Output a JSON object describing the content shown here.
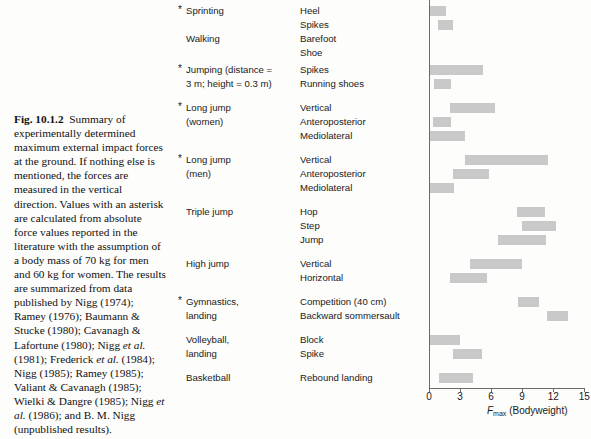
{
  "caption": {
    "figure_number": "Fig. 10.1.2",
    "text_1": "Summary of experimentally determined maximum external impact forces at the ground. If nothing else is mentioned, the forces are measured in the vertical direction. Values with an asterisk are calculated from absolute force values reported in the literature with the assumption of a body mass of 70 kg for men and 60 kg for women. The results are summarized from data published by Nigg (1974); Ramey (1976); Baumann & Stucke (1980); Cavanagh & Lafortune (1980); Nigg ",
    "italic_1": "et al.",
    "text_2": " (1981); Frederick ",
    "italic_2": "et al.",
    "text_3": " (1984); Nigg (1985); Ramey (1985); Valiant & Cavanagh (1985); Wielki & Dangre (1985); Nigg ",
    "italic_3": "et al.",
    "text_4": " (1986); and B. M. Nigg (unpublished results)."
  },
  "axis": {
    "xlabel_symbol": "F",
    "xlabel_sub": "max",
    "xlabel_unit": "(Bodyweight)",
    "ticks": [
      0,
      3,
      6,
      9,
      12,
      15
    ],
    "tick_labels": [
      "0",
      "3",
      "6",
      "9",
      "12",
      "15"
    ],
    "xmin": 0,
    "xmax": 15
  },
  "style": {
    "bar_color": "#c9c9c9",
    "axis_color": "#6b6b6b",
    "text_color": "#1a1a1a"
  },
  "chart_data": {
    "type": "bar",
    "subtype": "range-bar",
    "title": "Summary of experimentally determined maximum external impact forces at the ground",
    "xlabel": "Fmax (Bodyweight)",
    "ylabel": "",
    "xlim": [
      0,
      15
    ],
    "grid": false,
    "legend": null,
    "units": "bodyweight",
    "rows": [
      {
        "activity": "Sprinting",
        "asterisk": true,
        "condition": "Heel",
        "low": 0.1,
        "high": 1.6,
        "y": 4
      },
      {
        "activity": "",
        "asterisk": false,
        "condition": "Spikes",
        "low": 0.9,
        "high": 2.3,
        "y": 18
      },
      {
        "activity": "Walking",
        "asterisk": false,
        "condition": "Barefoot",
        "low": null,
        "high": null,
        "y": 32
      },
      {
        "activity": "",
        "asterisk": false,
        "condition": "Shoe",
        "low": null,
        "high": null,
        "y": 46
      },
      {
        "activity": "Jumping (distance =",
        "asterisk": true,
        "condition": "Spikes",
        "low": 0.1,
        "high": 5.2,
        "y": 63
      },
      {
        "activity": "3 m; height = 0.3 m)",
        "asterisk": false,
        "condition": "Running shoes",
        "low": 0.5,
        "high": 2.1,
        "y": 77
      },
      {
        "activity": "Long jump",
        "asterisk": true,
        "condition": "Vertical",
        "low": 2.0,
        "high": 6.4,
        "y": 101
      },
      {
        "activity": "(women)",
        "asterisk": false,
        "condition": "Anteroposterior",
        "low": 0.4,
        "high": 2.1,
        "y": 115
      },
      {
        "activity": "",
        "asterisk": false,
        "condition": "Mediolateral",
        "low": 0.1,
        "high": 3.5,
        "y": 129
      },
      {
        "activity": "Long jump",
        "asterisk": true,
        "condition": "Vertical",
        "low": 3.5,
        "high": 11.5,
        "y": 153
      },
      {
        "activity": "(men)",
        "asterisk": false,
        "condition": "Anteroposterior",
        "low": 2.3,
        "high": 5.8,
        "y": 167
      },
      {
        "activity": "",
        "asterisk": false,
        "condition": "Mediolateral",
        "low": 0.0,
        "high": 2.4,
        "y": 181
      },
      {
        "activity": "Triple jump",
        "asterisk": false,
        "condition": "Hop",
        "low": 8.5,
        "high": 11.2,
        "y": 205
      },
      {
        "activity": "",
        "asterisk": false,
        "condition": "Step",
        "low": 9.0,
        "high": 12.3,
        "y": 219
      },
      {
        "activity": "",
        "asterisk": false,
        "condition": "Jump",
        "low": 6.7,
        "high": 11.3,
        "y": 233
      },
      {
        "activity": "High jump",
        "asterisk": false,
        "condition": "Vertical",
        "low": 4.0,
        "high": 9.0,
        "y": 257
      },
      {
        "activity": "",
        "asterisk": false,
        "condition": "Horizontal",
        "low": 2.0,
        "high": 5.6,
        "y": 271
      },
      {
        "activity": "Gymnastics,",
        "asterisk": true,
        "condition": "Competition (40 cm)",
        "low": 8.6,
        "high": 10.6,
        "y": 295
      },
      {
        "activity": "landing",
        "asterisk": false,
        "condition": "Backward sommersault",
        "low": 11.4,
        "high": 13.4,
        "y": 309
      },
      {
        "activity": "Volleyball,",
        "asterisk": false,
        "condition": "Block",
        "low": 0.1,
        "high": 3.0,
        "y": 333
      },
      {
        "activity": "landing",
        "asterisk": false,
        "condition": "Spike",
        "low": 2.3,
        "high": 5.1,
        "y": 347
      },
      {
        "activity": "Basketball",
        "asterisk": false,
        "condition": "Rebound landing",
        "low": 1.0,
        "high": 4.3,
        "y": 371
      }
    ]
  }
}
